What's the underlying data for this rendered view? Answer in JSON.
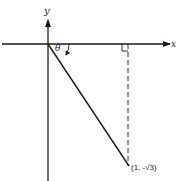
{
  "diagram": {
    "axes": {
      "x_label": "x",
      "y_label": "y"
    },
    "angle_label": "θ",
    "point_label": "(1, -√3)",
    "colors": {
      "stroke": "#1a1a1a",
      "background": "#ffffff"
    }
  }
}
